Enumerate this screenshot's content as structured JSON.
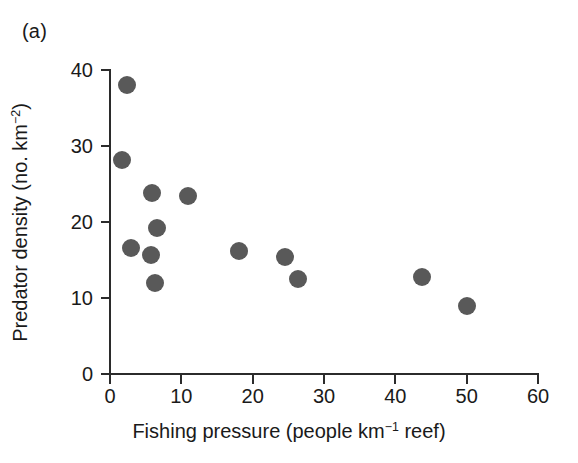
{
  "figure": {
    "panel_label": "(a)"
  },
  "chart_data": {
    "type": "scatter",
    "title": "",
    "subtitle": "",
    "xlabel": "Fishing pressure (people km−1 reef)",
    "xlabel_parts": {
      "pre": "Fishing pressure (people km",
      "sup": "−1",
      "post": " reef)"
    },
    "ylabel": "Predator density (no. km−2)",
    "ylabel_parts": {
      "pre": "Predator density (no. km",
      "sup": "−2",
      "post": ")"
    },
    "xlim": [
      0,
      60
    ],
    "ylim": [
      0,
      40
    ],
    "xticks": [
      0,
      10,
      20,
      30,
      40,
      50,
      60
    ],
    "yticks": [
      0,
      10,
      20,
      30,
      40
    ],
    "xticklabels": [
      "0",
      "10",
      "20",
      "30",
      "40",
      "50",
      "60"
    ],
    "yticklabels": [
      "0",
      "10",
      "20",
      "30",
      "40"
    ],
    "grid": false,
    "legend": null,
    "marker": {
      "shape": "circle",
      "color": "#595959",
      "size_px": 18
    },
    "series": [
      {
        "name": "Reef sites",
        "points": [
          {
            "x": 2.4,
            "y": 38.0
          },
          {
            "x": 1.7,
            "y": 28.1
          },
          {
            "x": 5.9,
            "y": 23.8
          },
          {
            "x": 10.9,
            "y": 23.4
          },
          {
            "x": 6.6,
            "y": 19.2
          },
          {
            "x": 2.9,
            "y": 16.6
          },
          {
            "x": 5.7,
            "y": 15.6
          },
          {
            "x": 6.3,
            "y": 12.0
          },
          {
            "x": 18.1,
            "y": 16.2
          },
          {
            "x": 24.5,
            "y": 15.4
          },
          {
            "x": 26.3,
            "y": 12.5
          },
          {
            "x": 43.8,
            "y": 12.8
          },
          {
            "x": 50.1,
            "y": 9.0
          }
        ]
      }
    ]
  }
}
